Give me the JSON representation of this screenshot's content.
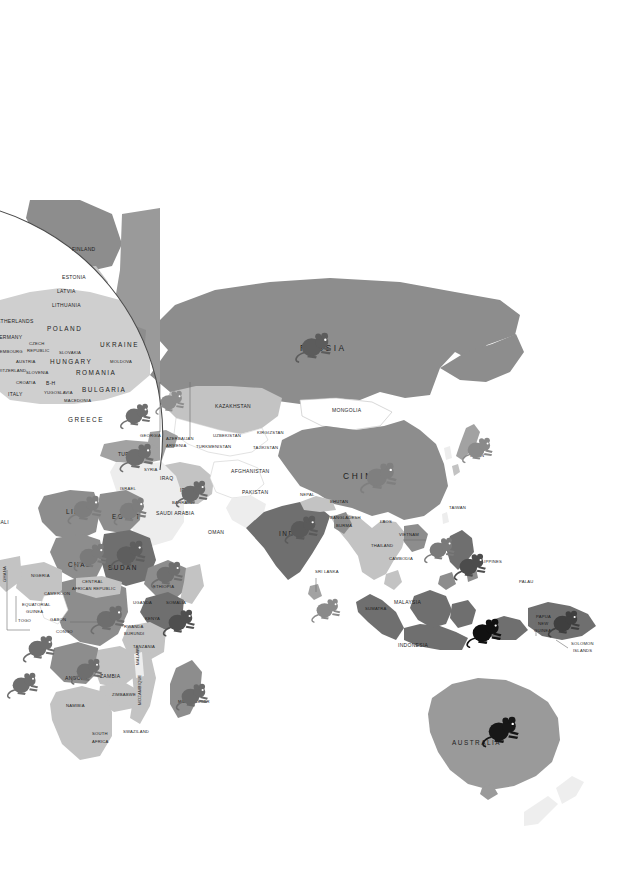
{
  "side_note": {
    "lines": [
      "The ",
      "Vancouver Island marmot",
      " suffered from habitat loss due to logging. A recovery program for this species includes captive breeding and re-introductions. In 2000 there were fewer than 50 in the wild."
    ],
    "species_bold": "Vancouver Island marmot",
    "prefix": "The ",
    "rest": " suffered from habitat loss due to logging. A recovery program for this species includes captive breeding and re-introductions. In 2000 there were fewer than 50 in the wild."
  },
  "legend": {
    "title_main": "T",
    "title": "THREATENED RODENTS",
    "title_word1_cap": "T",
    "title_word1_rest": "HREATENED",
    "title_word2_cap": "R",
    "title_word2_rest": "ODENTS",
    "left_subtitle_line1": "Number of species of rodents",
    "left_subtitle_line2": "classified as critically endangered,",
    "left_subtitle_line3_pre": "endangered or vulnerable ",
    "left_subtitle_year": "2000",
    "right_subtitle_line1": "Number of critically endangered",
    "right_subtitle_line2": "species of rodents",
    "choropleth": [
      {
        "label": "21 – 50",
        "color": "#6f6f6f"
      },
      {
        "label": "11 – 20",
        "color": "#8d8d8d"
      },
      {
        "label": "6 – 10",
        "color": "#a2a2a2"
      },
      {
        "label": "3 – 5",
        "color": "#c3c3c3"
      },
      {
        "label": "1 – 2",
        "color": "#ffffff"
      },
      {
        "label": "none or no data",
        "color": "#e8e8e8"
      }
    ],
    "symbols": [
      {
        "label": "1 – 2",
        "color": "#9c9c9c",
        "scale": 1.0
      },
      {
        "label": "3 – 4",
        "color": "#6e6e6e",
        "scale": 1.0
      },
      {
        "label": "5 – 6",
        "color": "#3c3c3c",
        "scale": 1.0
      },
      {
        "label": "9",
        "color": "#101010",
        "scale": 1.0
      }
    ]
  },
  "map": {
    "ocean_color": "#ffffff",
    "nodata_color": "#ededed",
    "country_labels": [
      {
        "name": "FINLAND",
        "x": 72,
        "y": 251,
        "cls": "sm"
      },
      {
        "name": "ESTONIA",
        "x": 62,
        "y": 279,
        "cls": "sm"
      },
      {
        "name": "LATVIA",
        "x": 57,
        "y": 293,
        "cls": "sm"
      },
      {
        "name": "LITHUANIA",
        "x": 52,
        "y": 307,
        "cls": "sm"
      },
      {
        "name": "NETHERLANDS",
        "x": -7,
        "y": 323,
        "cls": "sm"
      },
      {
        "name": "POLAND",
        "x": 47,
        "y": 331,
        "cls": "mid"
      },
      {
        "name": "GERMANY",
        "x": -5,
        "y": 339,
        "cls": "sm"
      },
      {
        "name": "CZECH",
        "x": 29,
        "y": 345,
        "cls": "tiny"
      },
      {
        "name": "REPUBLIC",
        "x": 27,
        "y": 352,
        "cls": "tiny"
      },
      {
        "name": "LUXEMBOURG",
        "x": -9,
        "y": 353,
        "cls": "tiny"
      },
      {
        "name": "SLOVAKIA",
        "x": 59,
        "y": 354,
        "cls": "tiny"
      },
      {
        "name": "AUSTRIA",
        "x": 16,
        "y": 363,
        "cls": "tiny"
      },
      {
        "name": "HUNGARY",
        "x": 50,
        "y": 364,
        "cls": "mid"
      },
      {
        "name": "MOLDOVA",
        "x": 110,
        "y": 363,
        "cls": "tiny"
      },
      {
        "name": "UKRAINE",
        "x": 100,
        "y": 347,
        "cls": "mid"
      },
      {
        "name": "SWITZERLAND",
        "x": -6,
        "y": 372,
        "cls": "tiny"
      },
      {
        "name": "SLOVENIA",
        "x": 26,
        "y": 374,
        "cls": "tiny"
      },
      {
        "name": "ROMANIA",
        "x": 76,
        "y": 375,
        "cls": "mid"
      },
      {
        "name": "CROATIA",
        "x": 16,
        "y": 384,
        "cls": "tiny"
      },
      {
        "name": "B-H",
        "x": 46,
        "y": 385,
        "cls": "sm"
      },
      {
        "name": "YUGOSLAVIA",
        "x": 44,
        "y": 394,
        "cls": "tiny"
      },
      {
        "name": "BULGARIA",
        "x": 82,
        "y": 392,
        "cls": "mid"
      },
      {
        "name": "ITALY",
        "x": 8,
        "y": 396,
        "cls": "sm"
      },
      {
        "name": "MACEDONIA",
        "x": 64,
        "y": 402,
        "cls": "tiny"
      },
      {
        "name": "GREECE",
        "x": 68,
        "y": 422,
        "cls": "mid"
      },
      {
        "name": "GEORGIA",
        "x": 140,
        "y": 437,
        "cls": "tiny"
      },
      {
        "name": "AZERBAIJAN",
        "x": 166,
        "y": 440,
        "cls": "tiny"
      },
      {
        "name": "ARMENIA",
        "x": 166,
        "y": 447,
        "cls": "tiny"
      },
      {
        "name": "TURKEY",
        "x": 118,
        "y": 456,
        "cls": "sm"
      },
      {
        "name": "TURKMENISTAN",
        "x": 196,
        "y": 448,
        "cls": "tiny"
      },
      {
        "name": "UZBEKISTAN",
        "x": 213,
        "y": 437,
        "cls": "tiny"
      },
      {
        "name": "KIRGIZSTAN",
        "x": 257,
        "y": 434,
        "cls": "tiny"
      },
      {
        "name": "TAJIKISTAN",
        "x": 253,
        "y": 449,
        "cls": "tiny"
      },
      {
        "name": "KAZAKHSTAN",
        "x": 215,
        "y": 408,
        "cls": "sm"
      },
      {
        "name": "MONGOLIA",
        "x": 332,
        "y": 412,
        "cls": "sm"
      },
      {
        "name": "RUSSIA",
        "x": 300,
        "y": 351,
        "cls": "big"
      },
      {
        "name": "CHINA",
        "x": 343,
        "y": 479,
        "cls": "big"
      },
      {
        "name": "JAPAN",
        "x": 470,
        "y": 457,
        "cls": "tiny"
      },
      {
        "name": "SYRIA",
        "x": 144,
        "y": 471,
        "cls": "tiny"
      },
      {
        "name": "IRAQ",
        "x": 160,
        "y": 480,
        "cls": "sm"
      },
      {
        "name": "ISRAEL",
        "x": 120,
        "y": 490,
        "cls": "tiny"
      },
      {
        "name": "IRAN",
        "x": 180,
        "y": 492,
        "cls": "sm"
      },
      {
        "name": "AFGHANISTAN",
        "x": 231,
        "y": 473,
        "cls": "sm"
      },
      {
        "name": "PAKISTAN",
        "x": 242,
        "y": 494,
        "cls": "sm"
      },
      {
        "name": "BAHRAIN",
        "x": 172,
        "y": 504,
        "cls": "tiny"
      },
      {
        "name": "SAUDI ARABIA",
        "x": 156,
        "y": 515,
        "cls": "sm"
      },
      {
        "name": "OMAN",
        "x": 208,
        "y": 534,
        "cls": "sm"
      },
      {
        "name": "NEPAL",
        "x": 300,
        "y": 496,
        "cls": "tiny"
      },
      {
        "name": "BHUTAN",
        "x": 330,
        "y": 503,
        "cls": "tiny"
      },
      {
        "name": "BANGLADESH",
        "x": 330,
        "y": 519,
        "cls": "tiny"
      },
      {
        "name": "INDIA",
        "x": 279,
        "y": 536,
        "cls": "mid"
      },
      {
        "name": "BURMA",
        "x": 336,
        "y": 527,
        "cls": "tiny"
      },
      {
        "name": "LAOS",
        "x": 380,
        "y": 523,
        "cls": "tiny"
      },
      {
        "name": "VIETNAM",
        "x": 399,
        "y": 536,
        "cls": "tiny"
      },
      {
        "name": "THAILAND",
        "x": 371,
        "y": 547,
        "cls": "tiny"
      },
      {
        "name": "CAMBODIA",
        "x": 389,
        "y": 560,
        "cls": "tiny"
      },
      {
        "name": "SRI LANKA",
        "x": 315,
        "y": 573,
        "cls": "tiny"
      },
      {
        "name": "TAIWAN",
        "x": 449,
        "y": 509,
        "cls": "tiny"
      },
      {
        "name": "PHILIPPINES",
        "x": 474,
        "y": 563,
        "cls": "tiny"
      },
      {
        "name": "PALAU",
        "x": 519,
        "y": 583,
        "cls": "tiny"
      },
      {
        "name": "MALAYSIA",
        "x": 394,
        "y": 604,
        "cls": "sm"
      },
      {
        "name": "SUMATRA",
        "x": 365,
        "y": 610,
        "cls": "tiny"
      },
      {
        "name": "INDONESIA",
        "x": 398,
        "y": 647,
        "cls": "sm"
      },
      {
        "name": "PAPUA",
        "x": 536,
        "y": 618,
        "cls": "tiny"
      },
      {
        "name": "NEW",
        "x": 538,
        "y": 625,
        "cls": "tiny"
      },
      {
        "name": "GUINEA",
        "x": 534,
        "y": 632,
        "cls": "tiny"
      },
      {
        "name": "SOLOMON",
        "x": 571,
        "y": 645,
        "cls": "tiny"
      },
      {
        "name": "ISLANDS",
        "x": 573,
        "y": 652,
        "cls": "tiny"
      },
      {
        "name": "AUSTRALIA",
        "x": 452,
        "y": 745,
        "cls": "mid"
      },
      {
        "name": "LIBYA",
        "x": 66,
        "y": 514,
        "cls": "mid"
      },
      {
        "name": "EGYPT",
        "x": 112,
        "y": 519,
        "cls": "mid"
      },
      {
        "name": "MALI",
        "x": -4,
        "y": 524,
        "cls": "sm"
      },
      {
        "name": "CHAD",
        "x": 68,
        "y": 567,
        "cls": "mid"
      },
      {
        "name": "SUDAN",
        "x": 108,
        "y": 570,
        "cls": "mid"
      },
      {
        "name": "NIGERIA",
        "x": 31,
        "y": 577,
        "cls": "tiny"
      },
      {
        "name": "CENTRAL",
        "x": 82,
        "y": 583,
        "cls": "tiny"
      },
      {
        "name": "AFRICAN REPUBLIC",
        "x": 72,
        "y": 590,
        "cls": "tiny"
      },
      {
        "name": "ETHIOPIA",
        "x": 153,
        "y": 588,
        "cls": "tiny"
      },
      {
        "name": "CAMEROON",
        "x": 44,
        "y": 595,
        "cls": "tiny"
      },
      {
        "name": "GHANA",
        "x": 6,
        "y": 582,
        "cls": "tiny",
        "rotate": -90
      },
      {
        "name": "EQUATORIAL",
        "x": 22,
        "y": 606,
        "cls": "tiny"
      },
      {
        "name": "GUINEA",
        "x": 26,
        "y": 613,
        "cls": "tiny"
      },
      {
        "name": "UGANDA",
        "x": 133,
        "y": 604,
        "cls": "tiny"
      },
      {
        "name": "SOMALIA",
        "x": 166,
        "y": 604,
        "cls": "tiny"
      },
      {
        "name": "KENYA",
        "x": 145,
        "y": 620,
        "cls": "tiny"
      },
      {
        "name": "TOGO",
        "x": 18,
        "y": 622,
        "cls": "tiny"
      },
      {
        "name": "GABON",
        "x": 50,
        "y": 621,
        "cls": "tiny"
      },
      {
        "name": "RWANDA",
        "x": 124,
        "y": 628,
        "cls": "tiny"
      },
      {
        "name": "BURUNDI",
        "x": 124,
        "y": 635,
        "cls": "tiny"
      },
      {
        "name": "CONGO",
        "x": 56,
        "y": 633,
        "cls": "tiny"
      },
      {
        "name": "TANZANIA",
        "x": 133,
        "y": 648,
        "cls": "tiny"
      },
      {
        "name": "MALAWI",
        "x": 139,
        "y": 665,
        "cls": "tiny",
        "rotate": -90
      },
      {
        "name": "ANGOLA",
        "x": 65,
        "y": 680,
        "cls": "sm"
      },
      {
        "name": "ZAMBIA",
        "x": 100,
        "y": 678,
        "cls": "sm"
      },
      {
        "name": "MADAGASCAR",
        "x": 178,
        "y": 703,
        "cls": "tiny"
      },
      {
        "name": "ZIMBABWE",
        "x": 112,
        "y": 696,
        "cls": "tiny"
      },
      {
        "name": "MOZAMBIQUE",
        "x": 141,
        "y": 705,
        "cls": "tiny",
        "rotate": -90
      },
      {
        "name": "NAMIBIA",
        "x": 66,
        "y": 707,
        "cls": "tiny"
      },
      {
        "name": "SOUTH",
        "x": 92,
        "y": 735,
        "cls": "tiny"
      },
      {
        "name": "AFRICA",
        "x": 92,
        "y": 743,
        "cls": "tiny"
      },
      {
        "name": "SWAZILAND",
        "x": 123,
        "y": 733,
        "cls": "tiny"
      }
    ],
    "symbol_markers": [
      {
        "region": "russia",
        "x": 301,
        "y": 332,
        "color": "#5c5c5c",
        "s": 1.18
      },
      {
        "region": "kazakhstan",
        "x": 125,
        "y": 403,
        "color": "#6e6e6e",
        "s": 1.0
      },
      {
        "region": "turkey",
        "x": 125,
        "y": 443,
        "color": "#6e6e6e",
        "s": 1.12
      },
      {
        "region": "caucasus",
        "x": 160,
        "y": 390,
        "color": "#8d8d8d",
        "s": 0.95
      },
      {
        "region": "iran",
        "x": 181,
        "y": 480,
        "color": "#6a6a6a",
        "s": 1.05
      },
      {
        "region": "china",
        "x": 366,
        "y": 462,
        "color": "#7f7f7f",
        "s": 1.2
      },
      {
        "region": "japan",
        "x": 467,
        "y": 437,
        "color": "#8a8a8a",
        "s": 1.0
      },
      {
        "region": "india",
        "x": 290,
        "y": 515,
        "color": "#5a5a5a",
        "s": 1.1
      },
      {
        "region": "sri-lanka",
        "x": 316,
        "y": 598,
        "color": "#8a8a8a",
        "s": 0.95
      },
      {
        "region": "vietnam",
        "x": 429,
        "y": 537,
        "color": "#7a7a7a",
        "s": 1.0
      },
      {
        "region": "philippines",
        "x": 459,
        "y": 553,
        "color": "#4c4c4c",
        "s": 1.05
      },
      {
        "region": "indonesia",
        "x": 472,
        "y": 618,
        "color": "#111111",
        "s": 1.15
      },
      {
        "region": "png",
        "x": 553,
        "y": 610,
        "color": "#3f3f3f",
        "s": 1.05
      },
      {
        "region": "australia",
        "x": 488,
        "y": 716,
        "color": "#171717",
        "s": 1.2
      },
      {
        "region": "libya",
        "x": 73,
        "y": 495,
        "color": "#7d7d7d",
        "s": 1.12
      },
      {
        "region": "egypt",
        "x": 119,
        "y": 497,
        "color": "#7d7d7d",
        "s": 1.08
      },
      {
        "region": "chad",
        "x": 79,
        "y": 543,
        "color": "#7a7a7a",
        "s": 1.08
      },
      {
        "region": "sudan",
        "x": 116,
        "y": 540,
        "color": "#5e5e5e",
        "s": 1.15
      },
      {
        "region": "ethiopia",
        "x": 156,
        "y": 561,
        "color": "#6e6e6e",
        "s": 1.05
      },
      {
        "region": "kenya",
        "x": 168,
        "y": 609,
        "color": "#4f4f4f",
        "s": 1.05
      },
      {
        "region": "congo-drc",
        "x": 96,
        "y": 605,
        "color": "#6e6e6e",
        "s": 1.12
      },
      {
        "region": "west-africa-1",
        "x": 28,
        "y": 635,
        "color": "#6e6e6e",
        "s": 1.05
      },
      {
        "region": "west-africa-2",
        "x": 12,
        "y": 672,
        "color": "#6e6e6e",
        "s": 1.02
      },
      {
        "region": "angola",
        "x": 76,
        "y": 658,
        "color": "#6e6e6e",
        "s": 1.02
      },
      {
        "region": "madagascar",
        "x": 181,
        "y": 683,
        "color": "#6a6a6a",
        "s": 1.05
      },
      {
        "region": "southern-africa",
        "x": 178,
        "y": 662,
        "color": "#6e6e6e",
        "s": 0.0
      }
    ]
  }
}
